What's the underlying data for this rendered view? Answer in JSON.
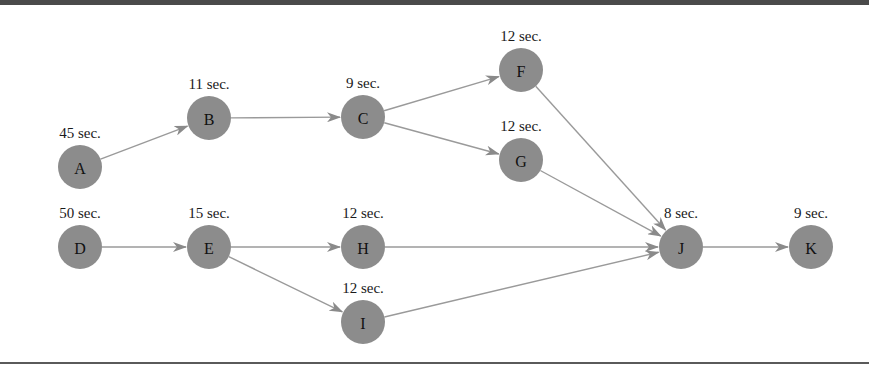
{
  "diagram": {
    "type": "activity-network",
    "colors": {
      "node_fill": "#8c8c8c",
      "edge": "#9a9a9a",
      "text": "#111111",
      "frame": "#4a4a4a"
    },
    "nodes": [
      {
        "id": "A",
        "label": "A",
        "duration": "45 sec.",
        "x": 80,
        "y": 167
      },
      {
        "id": "B",
        "label": "B",
        "duration": "11 sec.",
        "x": 209,
        "y": 118
      },
      {
        "id": "C",
        "label": "C",
        "duration": "9 sec.",
        "x": 363,
        "y": 117
      },
      {
        "id": "F",
        "label": "F",
        "duration": "12 sec.",
        "x": 521,
        "y": 70
      },
      {
        "id": "G",
        "label": "G",
        "duration": "12 sec.",
        "x": 521,
        "y": 160
      },
      {
        "id": "D",
        "label": "D",
        "duration": "50 sec.",
        "x": 80,
        "y": 247
      },
      {
        "id": "E",
        "label": "E",
        "duration": "15 sec.",
        "x": 209,
        "y": 247
      },
      {
        "id": "H",
        "label": "H",
        "duration": "12 sec.",
        "x": 363,
        "y": 247
      },
      {
        "id": "I",
        "label": "I",
        "duration": "12 sec.",
        "x": 363,
        "y": 322
      },
      {
        "id": "J",
        "label": "J",
        "duration": "8 sec.",
        "x": 681,
        "y": 247
      },
      {
        "id": "K",
        "label": "K",
        "duration": "9 sec.",
        "x": 811,
        "y": 247
      }
    ],
    "edges": [
      {
        "from": "A",
        "to": "B"
      },
      {
        "from": "B",
        "to": "C"
      },
      {
        "from": "C",
        "to": "F"
      },
      {
        "from": "C",
        "to": "G"
      },
      {
        "from": "F",
        "to": "J"
      },
      {
        "from": "G",
        "to": "J"
      },
      {
        "from": "D",
        "to": "E"
      },
      {
        "from": "E",
        "to": "H"
      },
      {
        "from": "E",
        "to": "I"
      },
      {
        "from": "H",
        "to": "J"
      },
      {
        "from": "I",
        "to": "J"
      },
      {
        "from": "J",
        "to": "K"
      }
    ],
    "node_radius": 22
  }
}
